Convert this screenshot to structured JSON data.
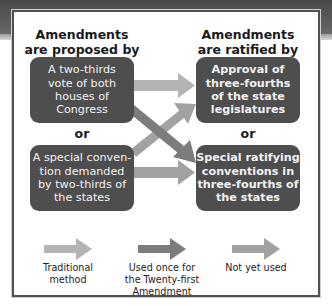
{
  "headings": {
    "proposed": "Amendments\nare proposed by",
    "ratified": "Amendments\nare ratified by"
  },
  "proposal_methods": [
    {
      "label": "A two-thirds\nvote of both\nhouses of\nCongress"
    },
    {
      "label": "A special conven-\ntion demanded\nby two-thirds of\nthe states"
    }
  ],
  "ratification_methods": [
    {
      "label": "Approval of\nthree-fourths\nof the state\nlegislatures"
    },
    {
      "label": "Special ratifying\nconventions in\nthree-fourths of\nthe states"
    }
  ],
  "or_label": "or",
  "legend": [
    {
      "label": "Traditional\nmethod",
      "color": "#b4b4b4"
    },
    {
      "label": "Used once for\nthe Twenty-first\nAmendment",
      "color": "#7c7c7c"
    },
    {
      "label": "Not yet used",
      "color": "#a2a2a2"
    }
  ],
  "colors": {
    "box": "#4e4e4e",
    "box_text": "#f2f2f2",
    "frame_border": "#505050",
    "traditional_arrow": "#b4b4b4",
    "used_once_arrow": "#7c7c7c",
    "not_yet_used_arrow": "#a2a2a2"
  }
}
